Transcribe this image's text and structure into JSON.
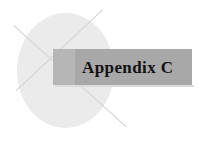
{
  "cover": {
    "banner": {
      "title": "Appendix C",
      "background_color": "#a8a8a8",
      "lead_color": "#b6b6b6",
      "text_color": "#121212"
    },
    "decoration": {
      "circle_color": "#ebebeb",
      "rule_color": "#d2d2d2"
    },
    "page_background": "#ffffff"
  }
}
